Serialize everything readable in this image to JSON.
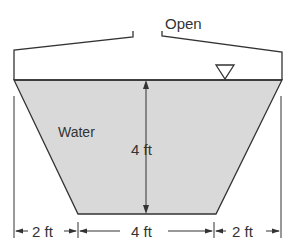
{
  "diagram": {
    "open_label": "Open",
    "water_label": "Water",
    "depth_label": "4 ft",
    "dimensions": {
      "left": "2 ft",
      "middle": "4 ft",
      "right": "2 ft"
    },
    "colors": {
      "water_fill": "#d9d9d9",
      "line": "#333333"
    }
  }
}
